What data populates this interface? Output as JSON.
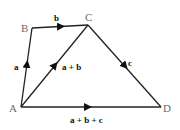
{
  "diagram": {
    "points": {
      "A": {
        "label": "A",
        "x": 21,
        "y": 107
      },
      "B": {
        "label": "B",
        "x": 32,
        "y": 28
      },
      "C": {
        "label": "C",
        "x": 88,
        "y": 25
      },
      "D": {
        "label": "D",
        "x": 161,
        "y": 107
      }
    },
    "vectors": [
      {
        "id": "a",
        "from": "A",
        "to": "B",
        "label": "a"
      },
      {
        "id": "b",
        "from": "B",
        "to": "C",
        "label": "b"
      },
      {
        "id": "c",
        "from": "C",
        "to": "D",
        "label": "c"
      },
      {
        "id": "a_plus_b",
        "from": "A",
        "to": "C",
        "label": "a + b"
      },
      {
        "id": "a_plus_b_plus_c",
        "from": "A",
        "to": "D",
        "label": "a + b + c"
      }
    ],
    "colors": {
      "line": "#222222",
      "point_label": "#6a6a6a",
      "vector_label": "#111111"
    }
  }
}
